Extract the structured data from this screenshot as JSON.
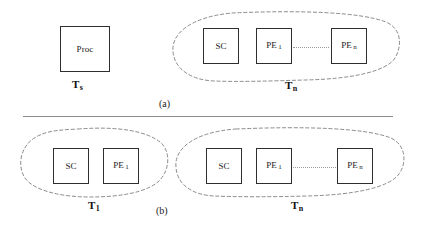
{
  "figure": {
    "background_color": "#ffffff",
    "box_border_color": "#2e2e2e",
    "blob_stroke_color": "#8a8a8a",
    "divider_color": "#8c8c8c",
    "link_color": "#9a9a9a"
  },
  "parts": [
    {
      "id": "a",
      "caption": "(a)"
    },
    {
      "id": "b",
      "caption": "(b)"
    }
  ],
  "part_a": {
    "single_task": {
      "group_label_base": "T",
      "group_label_sub": "s",
      "nodes": [
        {
          "base": "Proc",
          "sub": ""
        }
      ]
    },
    "parallel_task": {
      "group_label_base": "T",
      "group_label_sub": "n",
      "nodes": [
        {
          "base": "SC",
          "sub": ""
        },
        {
          "base": "PE",
          "sub": "1"
        },
        {
          "base": "PE",
          "sub": "n"
        }
      ],
      "link": "dotted-ellipsis"
    }
  },
  "part_b": {
    "first_task": {
      "group_label_base": "T",
      "group_label_sub": "1",
      "nodes": [
        {
          "base": "SC",
          "sub": ""
        },
        {
          "base": "PE",
          "sub": "1"
        }
      ]
    },
    "nth_task": {
      "group_label_base": "T",
      "group_label_sub": "n",
      "nodes": [
        {
          "base": "SC",
          "sub": ""
        },
        {
          "base": "PE",
          "sub": "1"
        },
        {
          "base": "PE",
          "sub": "n"
        }
      ],
      "link": "dotted-ellipsis"
    }
  }
}
